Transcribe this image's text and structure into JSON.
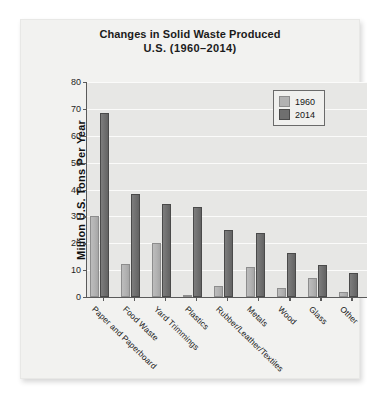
{
  "chart_data": {
    "type": "bar",
    "title": "Changes in Solid Waste Produced",
    "subtitle": "U.S.  (1960–2014)",
    "xlabel": "",
    "ylabel": "Million U.S. Tons Per Year",
    "ylim": [
      0,
      80
    ],
    "ytick_values": [
      0,
      10,
      20,
      30,
      40,
      50,
      60,
      70,
      80
    ],
    "ytick_labels": [
      "0",
      "10",
      "20",
      "30",
      "40",
      "50",
      "60",
      "70",
      "80"
    ],
    "grid": true,
    "legend_position": "top-right",
    "categories": [
      "Paper and Paperboard",
      "Food Waste",
      "Yard Trimmings",
      "Plastics",
      "Rubber/Leather/Textiles",
      "Metals",
      "Wood",
      "Glass",
      "Other"
    ],
    "series": [
      {
        "name": "1960",
        "color": "#b2b2b2",
        "values": [
          30.0,
          12.2,
          20.0,
          0.4,
          4.0,
          11.0,
          3.2,
          7.0,
          1.8
        ]
      },
      {
        "name": "2014",
        "color": "#6f6f6f",
        "values": [
          68.5,
          38.5,
          34.5,
          33.5,
          25.0,
          23.8,
          16.2,
          11.8,
          8.8
        ]
      }
    ]
  },
  "legend": {
    "entries": [
      {
        "label": "1960"
      },
      {
        "label": "2014"
      }
    ]
  }
}
